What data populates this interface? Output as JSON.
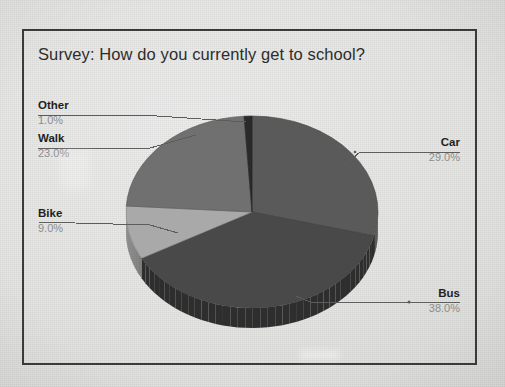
{
  "chart_data": {
    "type": "pie",
    "title": "Survey: How do you currently get to school?",
    "categories": [
      "Car",
      "Bus",
      "Bike",
      "Walk",
      "Other"
    ],
    "values": [
      29.0,
      38.0,
      9.0,
      23.0,
      1.0
    ],
    "labels": [
      {
        "name": "Other",
        "percent": "1.0%",
        "value": 1.0,
        "color": "#2b2b2b"
      },
      {
        "name": "Walk",
        "percent": "23.0%",
        "value": 23.0,
        "color": "#6f6f6f"
      },
      {
        "name": "Bike",
        "percent": "9.0%",
        "value": 9.0,
        "color": "#a9a9a9"
      },
      {
        "name": "Car",
        "percent": "29.0%",
        "value": 29.0,
        "color": "#5a5a5a"
      },
      {
        "name": "Bus",
        "percent": "38.0%",
        "value": 38.0,
        "color": "#4a4a4a"
      }
    ],
    "units": "percent",
    "legend": "none",
    "grid": false,
    "three_d": true,
    "start_angle_deg": 0,
    "direction": "clockwise",
    "xlabel": "",
    "ylabel": ""
  },
  "frame": {
    "border_color": "#3b3b3b",
    "background_color": "#e3e3e1"
  }
}
